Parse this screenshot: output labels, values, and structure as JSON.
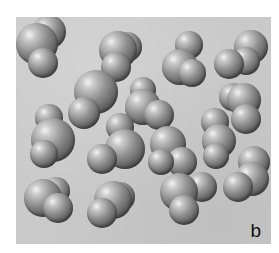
{
  "figure": {
    "panel_label": "b",
    "background_color": "#c9c9c9",
    "atom_color": "#8f8f8f",
    "molecules": [
      {
        "atoms": [
          {
            "x": 33,
            "y": 15,
            "r": 17
          },
          {
            "x": 21,
            "y": 27,
            "r": 21
          },
          {
            "x": 27,
            "y": 46,
            "r": 15
          }
        ]
      },
      {
        "atoms": [
          {
            "x": 111,
            "y": 30,
            "r": 15
          },
          {
            "x": 102,
            "y": 33,
            "r": 19
          },
          {
            "x": 100,
            "y": 50,
            "r": 15
          }
        ]
      },
      {
        "atoms": [
          {
            "x": 173,
            "y": 28,
            "r": 14
          },
          {
            "x": 164,
            "y": 50,
            "r": 18
          },
          {
            "x": 176,
            "y": 56,
            "r": 14
          }
        ]
      },
      {
        "atoms": [
          {
            "x": 235,
            "y": 30,
            "r": 17
          },
          {
            "x": 230,
            "y": 44,
            "r": 14
          },
          {
            "x": 213,
            "y": 47,
            "r": 15
          }
        ]
      },
      {
        "atoms": [
          {
            "x": 80,
            "y": 75,
            "r": 22
          },
          {
            "x": 68,
            "y": 96,
            "r": 16
          }
        ]
      },
      {
        "atoms": [
          {
            "x": 127,
            "y": 73,
            "r": 13
          },
          {
            "x": 127,
            "y": 90,
            "r": 18
          },
          {
            "x": 143,
            "y": 98,
            "r": 15
          }
        ]
      },
      {
        "atoms": [
          {
            "x": 217,
            "y": 80,
            "r": 14
          },
          {
            "x": 228,
            "y": 83,
            "r": 17
          },
          {
            "x": 230,
            "y": 102,
            "r": 15
          }
        ]
      },
      {
        "atoms": [
          {
            "x": 33,
            "y": 101,
            "r": 14
          },
          {
            "x": 37,
            "y": 123,
            "r": 22
          },
          {
            "x": 28,
            "y": 137,
            "r": 14
          }
        ]
      },
      {
        "atoms": [
          {
            "x": 104,
            "y": 110,
            "r": 14
          },
          {
            "x": 109,
            "y": 132,
            "r": 20
          },
          {
            "x": 86,
            "y": 142,
            "r": 15
          }
        ]
      },
      {
        "atoms": [
          {
            "x": 152,
            "y": 127,
            "r": 18
          },
          {
            "x": 166,
            "y": 145,
            "r": 15
          },
          {
            "x": 145,
            "y": 145,
            "r": 13
          }
        ]
      },
      {
        "atoms": [
          {
            "x": 199,
            "y": 105,
            "r": 14
          },
          {
            "x": 203,
            "y": 124,
            "r": 17
          },
          {
            "x": 200,
            "y": 139,
            "r": 13
          }
        ]
      },
      {
        "atoms": [
          {
            "x": 238,
            "y": 145,
            "r": 16
          },
          {
            "x": 236,
            "y": 162,
            "r": 17
          },
          {
            "x": 222,
            "y": 170,
            "r": 15
          }
        ]
      },
      {
        "atoms": [
          {
            "x": 40,
            "y": 174,
            "r": 14
          },
          {
            "x": 27,
            "y": 181,
            "r": 19
          },
          {
            "x": 42,
            "y": 191,
            "r": 15
          }
        ]
      },
      {
        "atoms": [
          {
            "x": 104,
            "y": 180,
            "r": 15
          },
          {
            "x": 97,
            "y": 183,
            "r": 19
          },
          {
            "x": 86,
            "y": 196,
            "r": 15
          }
        ]
      },
      {
        "atoms": [
          {
            "x": 186,
            "y": 170,
            "r": 15
          },
          {
            "x": 163,
            "y": 175,
            "r": 19
          },
          {
            "x": 168,
            "y": 193,
            "r": 15
          }
        ]
      }
    ]
  }
}
